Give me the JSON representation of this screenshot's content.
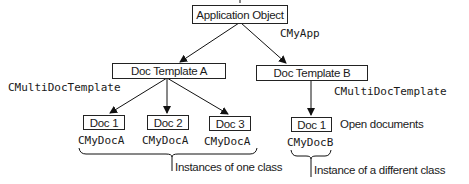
{
  "diagram": {
    "type": "hierarchy",
    "root": {
      "label": "Application Object",
      "class_name": "CMyApp"
    },
    "templates": [
      {
        "label": "Doc Template A",
        "class_name": "CMultiDocTemplate",
        "documents": [
          {
            "label": "Doc 1",
            "class_name": "CMyDocA"
          },
          {
            "label": "Doc 2",
            "class_name": "CMyDocA"
          },
          {
            "label": "Doc 3",
            "class_name": "CMyDocA"
          }
        ]
      },
      {
        "label": "Doc Template B",
        "class_name": "CMultiDocTemplate",
        "documents": [
          {
            "label": "Doc 1",
            "class_name": "CMyDocB"
          }
        ]
      }
    ],
    "annotations": {
      "open_documents": "Open documents",
      "instances_one_class": "Instances of one class",
      "instance_different_class": "Instance of a different class"
    }
  }
}
